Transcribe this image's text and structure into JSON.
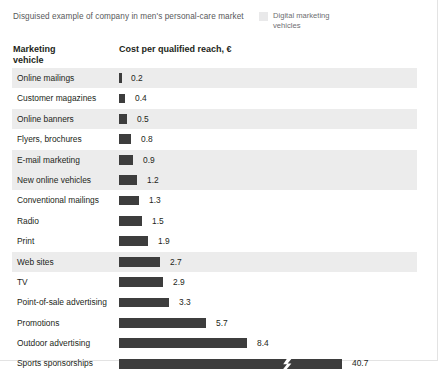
{
  "exhibit": {
    "subtitle": "Disguised example of company in men's personal-care market",
    "legend": {
      "swatch_name": "digital-marketing-swatch",
      "swatch_color": "#e9e9ea",
      "label": "Digital marketing vehicles"
    },
    "columns": {
      "vehicle_header_line1": "Marketing",
      "vehicle_header_line2": "vehicle",
      "cost_header": "Cost per qualified reach, €"
    },
    "bar_color": "#3d3d3d",
    "row_shade_color": "#ececec"
  },
  "chart_data": {
    "type": "bar",
    "orientation": "horizontal",
    "title": "Cost per qualified reach, €",
    "subtitle": "Disguised example of company in men's personal-care market",
    "xlabel": "Cost per qualified reach, €",
    "ylabel": "Marketing vehicle",
    "grid": false,
    "legend_position": "top-right",
    "legend_entries": [
      "Digital marketing vehicles"
    ],
    "axis_break": {
      "present": true,
      "applies_to": "Sports sponsorships",
      "note": "bar truncated with zigzag break mark"
    },
    "units": "EUR",
    "categories": [
      "Online mailings",
      "Customer magazines",
      "Online banners",
      "Flyers, brochures",
      "E-mail marketing",
      "New online vehicles",
      "Conventional mailings",
      "Radio",
      "Print",
      "Web sites",
      "TV",
      "Point-of-sale advertising",
      "Promotions",
      "Outdoor advertising",
      "Sports sponsorships"
    ],
    "values": [
      0.2,
      0.4,
      0.5,
      0.8,
      0.9,
      1.2,
      1.3,
      1.5,
      1.9,
      2.7,
      2.9,
      3.3,
      5.7,
      8.4,
      40.7
    ],
    "digital_flags": [
      true,
      false,
      true,
      false,
      true,
      true,
      false,
      false,
      false,
      true,
      false,
      false,
      false,
      false,
      false
    ]
  },
  "rows": [
    {
      "label": "Online mailings",
      "value": "0.2",
      "bar_px": 3,
      "label_x": 12,
      "digital": true,
      "break": false
    },
    {
      "label": "Customer magazines",
      "value": "0.4",
      "bar_px": 6,
      "label_x": 16,
      "digital": false,
      "break": false
    },
    {
      "label": "Online banners",
      "value": "0.5",
      "bar_px": 8,
      "label_x": 18,
      "digital": true,
      "break": false
    },
    {
      "label": "Flyers, brochures",
      "value": "0.8",
      "bar_px": 12,
      "label_x": 22,
      "digital": false,
      "break": false
    },
    {
      "label": "E-mail marketing",
      "value": "0.9",
      "bar_px": 14,
      "label_x": 24,
      "digital": true,
      "break": false
    },
    {
      "label": "New online vehicles",
      "value": "1.2",
      "bar_px": 18,
      "label_x": 28,
      "digital": true,
      "break": false
    },
    {
      "label": "Conventional mailings",
      "value": "1.3",
      "bar_px": 20,
      "label_x": 30,
      "digital": false,
      "break": false
    },
    {
      "label": "Radio",
      "value": "1.5",
      "bar_px": 23,
      "label_x": 33,
      "digital": false,
      "break": false
    },
    {
      "label": "Print",
      "value": "1.9",
      "bar_px": 29,
      "label_x": 39,
      "digital": false,
      "break": false
    },
    {
      "label": "Web sites",
      "value": "2.7",
      "bar_px": 41,
      "label_x": 51,
      "digital": true,
      "break": false
    },
    {
      "label": "TV",
      "value": "2.9",
      "bar_px": 44,
      "label_x": 54,
      "digital": false,
      "break": false
    },
    {
      "label": "Point-of-sale advertising",
      "value": "3.3",
      "bar_px": 50,
      "label_x": 60,
      "digital": false,
      "break": false
    },
    {
      "label": "Promotions",
      "value": "5.7",
      "bar_px": 87,
      "label_x": 97,
      "digital": false,
      "break": false
    },
    {
      "label": "Outdoor advertising",
      "value": "8.4",
      "bar_px": 128,
      "label_x": 138,
      "digital": false,
      "break": false
    },
    {
      "label": "Sports sponsorships",
      "value": "40.7",
      "bar_px": 223,
      "label_x": 233,
      "digital": false,
      "break": true,
      "break_x": 163
    }
  ]
}
